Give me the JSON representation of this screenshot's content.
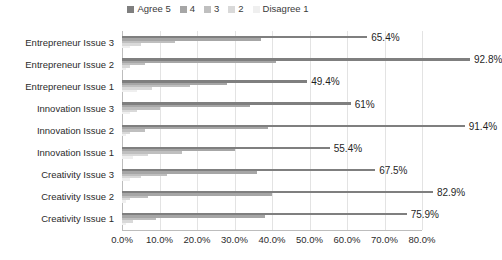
{
  "chart_data": {
    "type": "bar",
    "orientation": "horizontal",
    "grouping": "grouped",
    "title": "",
    "subtitle": "",
    "xlabel": "",
    "ylabel": "",
    "xlim": [
      0,
      80
    ],
    "xtick_labels": [
      "0.0%",
      "10.0%",
      "20.0%",
      "30.0%",
      "40.0%",
      "50.0%",
      "60.0%",
      "70.0%",
      "80.0%"
    ],
    "xtick_values": [
      0,
      10,
      20,
      30,
      40,
      50,
      60,
      70,
      80
    ],
    "grid": true,
    "grid_axis": "x",
    "legend_position": "top-center",
    "legend": [
      "Agree 5",
      "4",
      "3",
      "2",
      "Disagree 1"
    ],
    "series_colors": [
      "#7f7f7f",
      "#a6a6a6",
      "#bfbfbf",
      "#d9d9d9",
      "#efefef"
    ],
    "categories": [
      "Entrepreneur Issue 3",
      "Entrepreneur Issue 2",
      "Entrepreneur Issue 1",
      "Innovation Issue 3",
      "Innovation Issue 2",
      "Innovation Issue 1",
      "Creativity Issue 3",
      "Creativity Issue 2",
      "Creativity Issue 1"
    ],
    "series": [
      {
        "name": "Agree 5",
        "values": [
          65.4,
          92.8,
          49.4,
          61.0,
          91.4,
          55.4,
          67.5,
          82.9,
          75.9
        ]
      },
      {
        "name": "4",
        "values": [
          37.0,
          41.0,
          28.0,
          34.0,
          39.0,
          30.0,
          36.0,
          40.0,
          38.0
        ]
      },
      {
        "name": "3",
        "values": [
          14.0,
          6.0,
          18.0,
          10.0,
          6.0,
          16.0,
          12.0,
          7.0,
          9.0
        ]
      },
      {
        "name": "2",
        "values": [
          5.0,
          2.0,
          8.0,
          4.0,
          2.0,
          7.0,
          5.0,
          2.0,
          3.0
        ]
      },
      {
        "name": "Disagree 1",
        "values": [
          2.0,
          1.0,
          4.0,
          2.0,
          1.0,
          3.0,
          2.0,
          1.0,
          1.0
        ]
      }
    ],
    "data_labels": [
      "65.4%",
      "92.8%",
      "49.4%",
      "61%",
      "91.4%",
      "55.4%",
      "67.5%",
      "82.9%",
      "75.9%"
    ],
    "data_label_series": "Agree 5"
  }
}
